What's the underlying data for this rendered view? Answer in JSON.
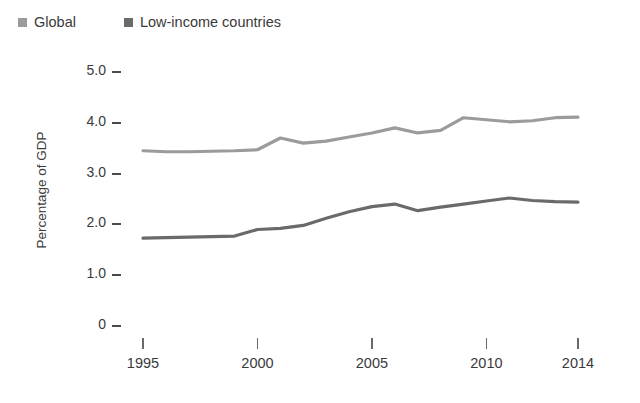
{
  "chart_data": {
    "type": "line",
    "title": "",
    "subtitle": "",
    "xlabel": "",
    "ylabel": "Percentage of GDP",
    "xlim": [
      1995,
      2014
    ],
    "ylim": [
      0,
      5.0
    ],
    "grid": false,
    "legend_position": "top-left",
    "x": [
      1995,
      1996,
      1997,
      1998,
      1999,
      2000,
      2001,
      2002,
      2003,
      2004,
      2005,
      2006,
      2007,
      2008,
      2009,
      2010,
      2011,
      2012,
      2013,
      2014
    ],
    "y_ticks": [
      "0",
      "1.0",
      "2.0",
      "3.0",
      "4.0",
      "5.0"
    ],
    "y_tick_values": [
      0,
      1.0,
      2.0,
      3.0,
      4.0,
      5.0
    ],
    "x_ticks": [
      "1995",
      "2000",
      "2005",
      "2010",
      "2014"
    ],
    "x_tick_values": [
      1995,
      2000,
      2005,
      2010,
      2014
    ],
    "series": [
      {
        "name": "Global",
        "color": "#9b9b9b",
        "values": [
          3.45,
          3.43,
          3.43,
          3.44,
          3.45,
          3.47,
          3.7,
          3.6,
          3.64,
          3.72,
          3.8,
          3.9,
          3.8,
          3.85,
          4.1,
          4.06,
          4.02,
          4.04,
          4.1,
          4.11
        ]
      },
      {
        "name": "Low-income countries",
        "color": "#6a6a6a",
        "values": [
          1.73,
          1.74,
          1.75,
          1.76,
          1.77,
          1.9,
          1.92,
          1.98,
          2.12,
          2.25,
          2.35,
          2.4,
          2.27,
          2.34,
          2.4,
          2.46,
          2.52,
          2.47,
          2.45,
          2.44
        ]
      }
    ]
  },
  "legend": {
    "items": [
      {
        "label": "Global",
        "color": "#9b9b9b"
      },
      {
        "label": "Low-income countries",
        "color": "#6a6a6a"
      }
    ]
  },
  "axes": {
    "y_title": "Percentage of GDP"
  }
}
